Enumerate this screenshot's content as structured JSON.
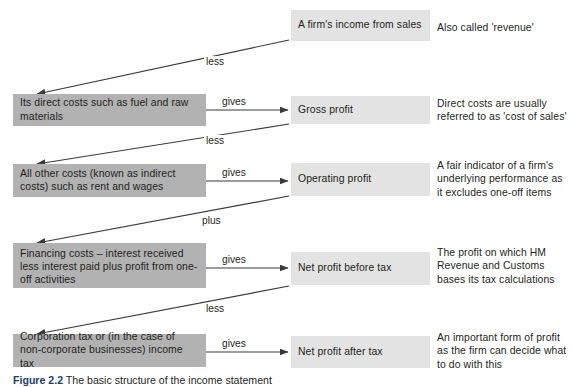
{
  "diagram": {
    "title": "The basic structure of the income statement",
    "caption_prefix": "Figure 2.2",
    "caption_text": "The basic structure of the income statement",
    "colors": {
      "cost_box": "#b2b2b2",
      "profit_box": "#e3e3e3",
      "arrow": "#3a3a3a",
      "text": "#231f20"
    },
    "rows": [
      {
        "cost_box": null,
        "profit_box": "A firm's income from sales",
        "note": "Also called 'revenue'",
        "gives_label": null,
        "down_label": "less"
      },
      {
        "cost_box": "Its direct costs such as fuel and raw materials",
        "profit_box": "Gross profit",
        "note": "Direct costs are usually referred to as 'cost of sales'",
        "gives_label": "gives",
        "down_label": "less"
      },
      {
        "cost_box": "All other costs (known as indirect costs) such as rent and wages",
        "profit_box": "Operating profit",
        "note": "A fair indicator of a firm's underlying performance as it excludes one-off items",
        "gives_label": "gives",
        "down_label": "plus"
      },
      {
        "cost_box": "Financing costs – interest received less interest paid plus profit from one-off activities",
        "profit_box": "Net profit before tax",
        "note": "The profit on which HM Revenue and Customs bases its tax calculations",
        "gives_label": "gives",
        "down_label": "less"
      },
      {
        "cost_box": "Corporation tax or (in the case of non-corporate businesses) income tax",
        "profit_box": "Net profit after tax",
        "note": "An important form of profit as the firm can decide what to do with this",
        "gives_label": "gives",
        "down_label": null
      }
    ]
  }
}
